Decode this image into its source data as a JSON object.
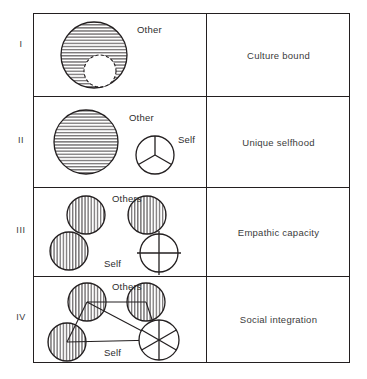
{
  "figure": {
    "type": "diagram",
    "columns": [
      "diagram",
      "stage_label"
    ],
    "line_color": "#231f20",
    "background": "#ffffff"
  },
  "rows": [
    {
      "numeral": "I",
      "label": "Culture bound",
      "glyph_labels": {
        "other": "Other"
      },
      "shapes": [
        {
          "name": "other-mass",
          "kind": "circle",
          "hatch": "horizontal",
          "cx": 60,
          "cy": 41,
          "r": 33
        },
        {
          "name": "self-void",
          "kind": "circle",
          "hatch": "none",
          "cx": 66,
          "cy": 57,
          "r": 16
        }
      ]
    },
    {
      "numeral": "II",
      "label": "Unique selfhood",
      "glyph_labels": {
        "other": "Other",
        "self": "Self"
      },
      "shapes": [
        {
          "name": "other-mass",
          "kind": "circle",
          "hatch": "horizontal",
          "cx": 52,
          "cy": 45,
          "r": 32
        },
        {
          "name": "self-circle",
          "kind": "circle",
          "hatch": "none",
          "spokes": 3,
          "cx": 121,
          "cy": 58,
          "r": 19
        }
      ]
    },
    {
      "numeral": "III",
      "label": "Empathic capacity",
      "glyph_labels": {
        "others": "Others",
        "self": "Self"
      },
      "shapes": [
        {
          "name": "other-circle-1",
          "kind": "circle",
          "hatch": "vertical",
          "cx": 52,
          "cy": 27,
          "r": 19
        },
        {
          "name": "other-circle-2",
          "kind": "circle",
          "hatch": "vertical",
          "cx": 113,
          "cy": 27,
          "r": 19
        },
        {
          "name": "other-circle-3",
          "kind": "circle",
          "hatch": "vertical",
          "cx": 35,
          "cy": 63,
          "r": 19
        },
        {
          "name": "self-circle",
          "kind": "circle",
          "hatch": "none",
          "spokes": 4,
          "cx": 125,
          "cy": 65,
          "r": 19
        }
      ]
    },
    {
      "numeral": "IV",
      "label": "Social integration",
      "glyph_labels": {
        "others": "Others",
        "self": "Self"
      },
      "shapes": [
        {
          "name": "other-circle-1",
          "kind": "circle",
          "hatch": "vertical",
          "cx": 53,
          "cy": 25,
          "r": 19
        },
        {
          "name": "other-circle-2",
          "kind": "circle",
          "hatch": "vertical",
          "cx": 112,
          "cy": 25,
          "r": 19
        },
        {
          "name": "other-circle-3",
          "kind": "circle",
          "hatch": "vertical",
          "cx": 33,
          "cy": 65,
          "r": 19
        },
        {
          "name": "self-circle",
          "kind": "circle",
          "hatch": "none",
          "spokes": 6,
          "cx": 125,
          "cy": 63,
          "r": 20
        }
      ],
      "connections": [
        [
          "other-circle-1",
          "other-circle-2"
        ],
        [
          "other-circle-1",
          "other-circle-3"
        ],
        [
          "other-circle-1",
          "self-circle"
        ],
        [
          "other-circle-2",
          "self-circle"
        ],
        [
          "other-circle-3",
          "self-circle"
        ]
      ]
    }
  ]
}
